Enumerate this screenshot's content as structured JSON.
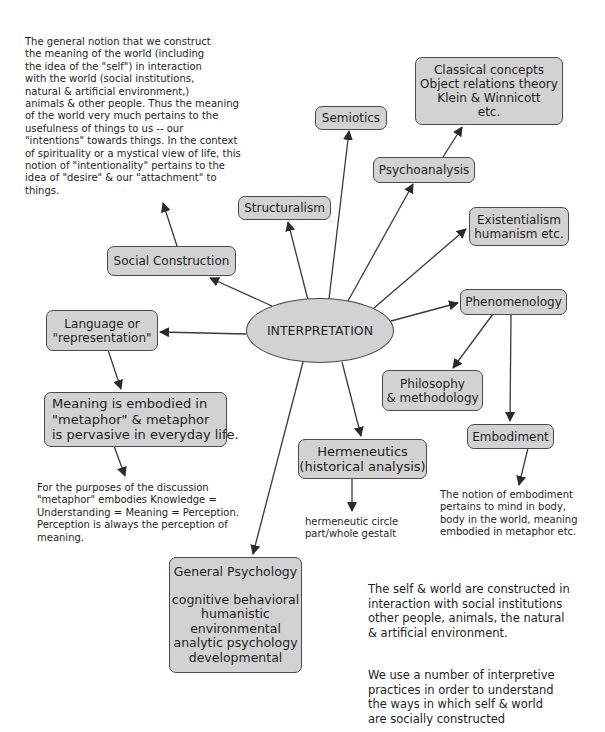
{
  "central": {
    "label": "INTERPRETATION"
  },
  "nodes": {
    "semiotics": {
      "lines": [
        "Semiotics"
      ]
    },
    "classical": {
      "lines": [
        "Classical concepts",
        "Object relations theory",
        "Klein & Winnicott",
        "etc."
      ]
    },
    "psychoanalysis": {
      "lines": [
        "Psychoanalysis"
      ]
    },
    "structuralism": {
      "lines": [
        "Structuralism"
      ]
    },
    "existentialism": {
      "lines": [
        "Existentialism",
        "humanism etc."
      ]
    },
    "social_construction": {
      "lines": [
        "Social Construction"
      ]
    },
    "phenomenology": {
      "lines": [
        "Phenomenology"
      ]
    },
    "language": {
      "lines": [
        "Language or",
        "\"representation\""
      ]
    },
    "philosophy": {
      "lines": [
        "Philosophy",
        "& methodology"
      ]
    },
    "meaning": {
      "lines": [
        "Meaning is embodied in",
        "\"metaphor\" & metaphor",
        "is pervasive in everyday life."
      ]
    },
    "embodiment": {
      "lines": [
        "Embodiment"
      ]
    },
    "hermeneutics": {
      "lines": [
        "Hermeneutics",
        "(historical analysis)"
      ]
    },
    "general_psychology": {
      "title": "General Psychology",
      "lines": [
        "cognitive behavioral",
        "humanistic",
        "environmental",
        "analytic psychology",
        "developmental"
      ]
    }
  },
  "notes": {
    "social_construction_note": {
      "lines": [
        "The general notion that we construct",
        "the meaning of the world (including",
        "the idea of the \"self\") in interaction",
        "with the world (social institutions,",
        "natural & artificial environment,)",
        "animals & other people. Thus the meaning",
        "of the world very much pertains to the",
        "usefulness of things to us -- our",
        "\"intentions\" towards things. In the context",
        "of spirituality or a mystical view of life, this",
        "notion of \"intentionality\" pertains to the",
        "idea of \"desire\" & our \"attachment\" to",
        "things."
      ]
    },
    "metaphor_note": {
      "lines": [
        "For the purposes of the discussion",
        "\"metaphor\" embodies Knowledge =",
        "Understanding = Meaning = Perception.",
        "Perception is always the perception of",
        "meaning."
      ]
    },
    "hermeneutic_note": {
      "lines": [
        "hermeneutic circle",
        "part/whole gestalt"
      ]
    },
    "embodiment_note": {
      "lines": [
        "The notion of embodiment",
        "pertains to mind in body,",
        "body in the world, meaning",
        "embodied in metaphor etc."
      ]
    },
    "self_world_note": {
      "lines": [
        "The self & world are constructed in",
        "interaction with social institutions",
        "other people, animals, the natural",
        "& artificial environment."
      ]
    },
    "practices_note": {
      "lines": [
        "We use a number of interpretive",
        "practices in order to understand",
        "the ways in which self & world",
        "are socially constructed"
      ]
    }
  },
  "colors": {
    "node_fill": "#d2d2d2",
    "node_border": "#4a4a4a",
    "line": "#3a3a3a",
    "text": "#1e1e1e",
    "background": "#ffffff"
  }
}
